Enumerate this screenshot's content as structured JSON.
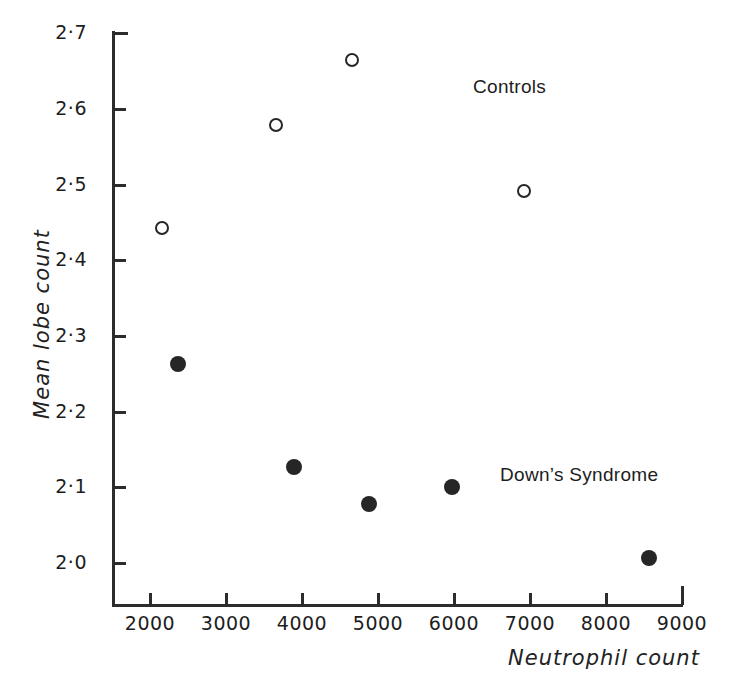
{
  "chart_data": {
    "type": "scatter",
    "title": "",
    "xlabel": "Neutrophil count",
    "ylabel": "Mean lobe count",
    "xlim": [
      1500,
      9000
    ],
    "ylim": [
      2.0,
      2.7
    ],
    "xticks": [
      2000,
      3000,
      4000,
      5000,
      6000,
      7000,
      8000,
      9000
    ],
    "xticklabels": [
      "2000",
      "3000",
      "4000",
      "5000",
      "6000",
      "7000",
      "8000",
      "9000"
    ],
    "yticks": [
      2.0,
      2.1,
      2.2,
      2.3,
      2.4,
      2.5,
      2.6,
      2.7
    ],
    "yticklabels": [
      "2·0",
      "2·1",
      "2·2",
      "2·3",
      "2·4",
      "2·5",
      "2·6",
      "2·7"
    ],
    "grid": false,
    "legend": "inline-annotations",
    "annotations": [
      {
        "name": "controls",
        "text": "Controls",
        "x": 6460,
        "y": 2.6
      },
      {
        "name": "downs-syndrome",
        "text": "Down’s Syndrome",
        "x": 6820,
        "y": 2.12
      }
    ],
    "series": [
      {
        "name": "Controls",
        "marker": "open-circle",
        "color": "#262626",
        "points": [
          {
            "x": 2160,
            "y": 2.443
          },
          {
            "x": 3660,
            "y": 2.578
          },
          {
            "x": 4660,
            "y": 2.664
          },
          {
            "x": 6920,
            "y": 2.492
          }
        ]
      },
      {
        "name": "Down’s Syndrome",
        "marker": "filled-circle",
        "color": "#262626",
        "points": [
          {
            "x": 2370,
            "y": 2.263
          },
          {
            "x": 3900,
            "y": 2.127
          },
          {
            "x": 4880,
            "y": 2.078
          },
          {
            "x": 5970,
            "y": 2.1
          },
          {
            "x": 8560,
            "y": 2.006
          }
        ]
      }
    ]
  },
  "axes": {
    "x_title": "Neutrophil count",
    "y_title": "Mean lobe count"
  },
  "colors": {
    "ink": "#262626",
    "background": "#ffffff"
  }
}
